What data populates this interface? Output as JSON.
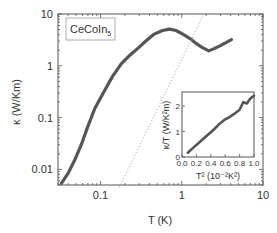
{
  "chart_data": [
    {
      "type": "line",
      "title": "",
      "annotation": "CeCoIn5",
      "xlabel": "T (K)",
      "ylabel": "κ (W/Km)",
      "xscale": "log",
      "yscale": "log",
      "xlim": [
        0.03,
        10
      ],
      "ylim": [
        0.005,
        10
      ],
      "xticks": [
        0.1,
        1,
        10
      ],
      "xtick_labels": [
        "0.1",
        "1",
        "10"
      ],
      "yticks": [
        0.01,
        0.1,
        1,
        10
      ],
      "ytick_labels": [
        "0.01",
        "0.1",
        "1",
        "10"
      ],
      "grid": false,
      "series": [
        {
          "name": "CeCoIn5 thermal conductivity",
          "style": "thick-markers",
          "color": "#555555",
          "x": [
            0.033,
            0.04,
            0.048,
            0.058,
            0.069,
            0.085,
            0.112,
            0.14,
            0.18,
            0.23,
            0.29,
            0.37,
            0.46,
            0.58,
            0.71,
            0.85,
            1.03,
            1.25,
            1.53,
            1.8,
            2.15,
            2.5,
            2.95,
            3.5,
            4.1
          ],
          "y": [
            0.0054,
            0.0085,
            0.015,
            0.03,
            0.064,
            0.15,
            0.33,
            0.62,
            1.09,
            1.6,
            2.2,
            3.1,
            4.1,
            4.8,
            5.1,
            4.8,
            4.1,
            3.4,
            2.65,
            2.25,
            1.94,
            2.15,
            2.42,
            2.8,
            3.2
          ]
        },
        {
          "name": "phonon reference line",
          "style": "dotted",
          "color": "#aaaaaa",
          "x": [
            0.17,
            1.82
          ],
          "y": [
            0.0045,
            9.1
          ]
        }
      ]
    },
    {
      "type": "scatter",
      "title": "",
      "xlabel": "T² (10⁻²K²)",
      "ylabel": "κ/T (W/K²m)",
      "xlim": [
        0.0,
        1.0
      ],
      "ylim": [
        0,
        2.55
      ],
      "xticks": [
        0.0,
        0.2,
        0.4,
        0.6,
        0.8,
        1.0
      ],
      "xtick_labels": [
        "0.0",
        "0.2",
        "0.4",
        "0.6",
        "0.8",
        "1.0"
      ],
      "yticks": [
        0,
        1,
        2
      ],
      "ytick_labels": [
        "0",
        "1",
        "2"
      ],
      "grid": false,
      "legend_position": "inset lower-right",
      "series": [
        {
          "name": "κ/T vs T²",
          "color": "#555555",
          "x": [
            0.08,
            0.15,
            0.22,
            0.3,
            0.38,
            0.45,
            0.52,
            0.6,
            0.65,
            0.72,
            0.8,
            0.85,
            0.9,
            0.95,
            1.0
          ],
          "y": [
            0.17,
            0.35,
            0.52,
            0.72,
            0.92,
            1.1,
            1.3,
            1.48,
            1.55,
            1.68,
            1.85,
            2.15,
            2.1,
            2.3,
            2.4
          ]
        }
      ]
    }
  ],
  "labels": {
    "sample": "CeCoIn",
    "sample_sub": "5",
    "ylabel": "κ (W/Km)",
    "xlabel": "T (K)",
    "inset_ylabel": "κ/T (W/K²m)",
    "inset_xlabel": "T² (10⁻²K²)"
  }
}
